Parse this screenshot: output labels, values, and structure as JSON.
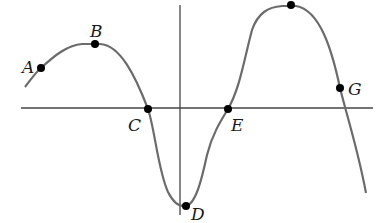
{
  "figure": {
    "axes": {
      "x_axis": {
        "x1": 21,
        "x2": 373,
        "y": 108
      },
      "y_axis": {
        "x": 180,
        "y1": 5,
        "y2": 215
      }
    },
    "curve_color": "#6b6b6b",
    "axis_color": "#444444",
    "point_color": "#000000",
    "points": [
      {
        "label": "A",
        "x": 41,
        "y": 68,
        "label_x": 22,
        "label_y": 73
      },
      {
        "label": "B",
        "x": 95,
        "y": 44,
        "label_x": 90,
        "label_y": 37
      },
      {
        "label": "C",
        "x": 148,
        "y": 109,
        "label_x": 128,
        "label_y": 131
      },
      {
        "label": "D",
        "x": 186,
        "y": 206,
        "label_x": 191,
        "label_y": 220
      },
      {
        "label": "E",
        "x": 228,
        "y": 109,
        "label_x": 231,
        "label_y": 131
      },
      {
        "label": "",
        "x": 291,
        "y": 5,
        "label_x": 0,
        "label_y": 0
      },
      {
        "label": "G",
        "x": 340,
        "y": 88,
        "label_x": 348,
        "label_y": 95
      }
    ]
  }
}
